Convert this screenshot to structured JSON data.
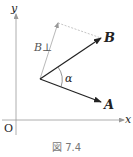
{
  "figure": {
    "caption": "図 7.4",
    "labels": {
      "y_axis": "y",
      "x_axis": "x",
      "origin": "O",
      "vector_b": "B",
      "vector_a": "A",
      "b_perp": "B⊥",
      "angle": "α"
    },
    "colors": {
      "vector": "#222222",
      "axis": "#888888",
      "projection": "#999999"
    }
  }
}
